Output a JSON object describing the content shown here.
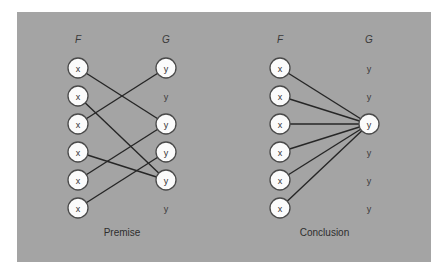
{
  "diagrams": [
    {
      "id": "premise",
      "caption": "Premise",
      "domain_label": "F",
      "codomain_label": "G",
      "f_x": 78,
      "g_x": 166,
      "domain_nodes": [
        "x",
        "x",
        "x",
        "x",
        "x",
        "x"
      ],
      "codomain_nodes": [
        {
          "label": "y",
          "circled": true
        },
        {
          "label": "y",
          "circled": false
        },
        {
          "label": "y",
          "circled": true
        },
        {
          "label": "y",
          "circled": true
        },
        {
          "label": "y",
          "circled": true
        },
        {
          "label": "y",
          "circled": false
        }
      ],
      "edges": [
        [
          0,
          2
        ],
        [
          1,
          4
        ],
        [
          2,
          0
        ],
        [
          3,
          4
        ],
        [
          4,
          2
        ],
        [
          5,
          3
        ]
      ]
    },
    {
      "id": "conclusion",
      "caption": "Conclusion",
      "domain_label": "F",
      "codomain_label": "G",
      "f_x": 280,
      "g_x": 369,
      "domain_nodes": [
        "x",
        "x",
        "x",
        "x",
        "x",
        "x"
      ],
      "codomain_nodes": [
        {
          "label": "y",
          "circled": false
        },
        {
          "label": "y",
          "circled": false
        },
        {
          "label": "y",
          "circled": true
        },
        {
          "label": "y",
          "circled": false
        },
        {
          "label": "y",
          "circled": false
        },
        {
          "label": "y",
          "circled": false
        }
      ],
      "edges": [
        [
          0,
          2
        ],
        [
          1,
          2
        ],
        [
          2,
          2
        ],
        [
          3,
          2
        ],
        [
          4,
          2
        ],
        [
          5,
          2
        ]
      ]
    }
  ],
  "layout": {
    "row_start_y": 68,
    "row_gap": 28,
    "label_y": 43,
    "caption_y": 236,
    "node_radius": 10
  },
  "colors": {
    "panel": "#a4a4a4",
    "node_fill": "#fbfbfb",
    "edge": "#262626"
  }
}
